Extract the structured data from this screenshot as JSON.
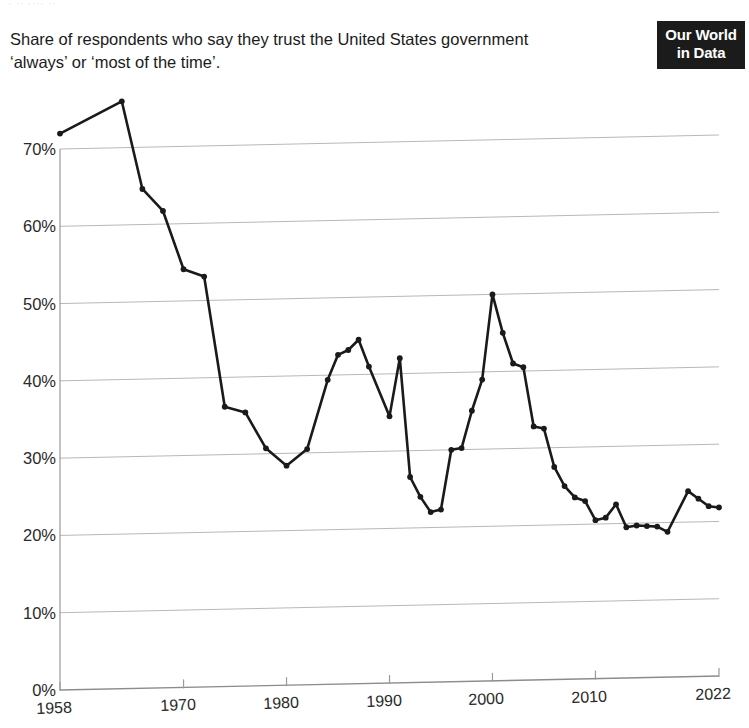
{
  "top_remnant": "· ·· ···· ··",
  "subtitle": "Share of respondents who say they trust the United States government ‘always’ or ‘most of the time’.",
  "logo": {
    "line1": "Our World",
    "line2": "in Data"
  },
  "chart_data": {
    "type": "line",
    "title": "",
    "subtitle": "Share of respondents who say they trust the United States government ‘always’ or ‘most of the time’.",
    "xlabel": "",
    "ylabel": "",
    "xlim": [
      1958,
      2022
    ],
    "ylim": [
      0,
      70
    ],
    "grid": true,
    "legend": null,
    "y_ticks": [
      0,
      10,
      20,
      30,
      40,
      50,
      60,
      70
    ],
    "y_tick_labels": [
      "0%",
      "10%",
      "20%",
      "30%",
      "40%",
      "50%",
      "60%",
      "70%"
    ],
    "x_ticks": [
      1958,
      1970,
      1980,
      1990,
      2000,
      2010,
      2022
    ],
    "x_tick_labels": [
      "1958",
      "1970",
      "1980",
      "1990",
      "2000",
      "2010",
      "2022"
    ],
    "line_color": "#1a1a1a",
    "marker": "circle",
    "series": [
      {
        "name": "Trust in US government",
        "x": [
          1958,
          1964,
          1966,
          1968,
          1970,
          1972,
          1974,
          1976,
          1978,
          1980,
          1982,
          1984,
          1985,
          1986,
          1987,
          1988,
          1990,
          1991,
          1992,
          1993,
          1994,
          1995,
          1996,
          1997,
          1998,
          1999,
          2000,
          2001,
          2002,
          2003,
          2004,
          2005,
          2006,
          2007,
          2008,
          2009,
          2010,
          2011,
          2012,
          2013,
          2014,
          2015,
          2016,
          2017,
          2019,
          2020,
          2021,
          2022
        ],
        "values": [
          72.0,
          76.0,
          64.6,
          61.7,
          54.1,
          53.1,
          36.2,
          35.4,
          30.7,
          28.4,
          30.5,
          39.4,
          42.6,
          43.2,
          44.5,
          41.0,
          34.5,
          42.0,
          26.6,
          24.0,
          22.0,
          22.3,
          30.0,
          30.2,
          35.0,
          39.0,
          50.0,
          45.0,
          41.0,
          40.5,
          32.8,
          32.5,
          27.5,
          25.0,
          23.5,
          23.0,
          20.5,
          20.8,
          22.5,
          19.5,
          19.7,
          19.6,
          19.5,
          18.8,
          24.0,
          23.0,
          22.0,
          21.8
        ]
      }
    ]
  }
}
